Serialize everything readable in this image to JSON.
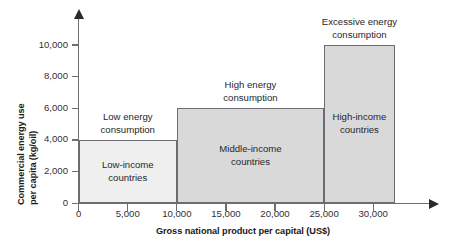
{
  "chart_data": {
    "type": "bar",
    "title": "",
    "xlabel": "Gross national product per capital (US$)",
    "ylabel_line1": "Commercial energy use",
    "ylabel_line2": "per capita (kg/oil)",
    "xlim": [
      0,
      36000
    ],
    "ylim": [
      0,
      11500
    ],
    "grid": false,
    "legend": "none",
    "x_ticks": [
      {
        "value": 0,
        "label": "0"
      },
      {
        "value": 5000,
        "label": "5,000"
      },
      {
        "value": 10000,
        "label": "10,000"
      },
      {
        "value": 15000,
        "label": "15,000"
      },
      {
        "value": 20000,
        "label": "20,000"
      },
      {
        "value": 25000,
        "label": "25,000"
      },
      {
        "value": 30000,
        "label": "30,000"
      }
    ],
    "y_ticks": [
      {
        "value": 0,
        "label": "0"
      },
      {
        "value": 2000,
        "label": "2,000"
      },
      {
        "value": 4000,
        "label": "4,000"
      },
      {
        "value": 6000,
        "label": "6,000"
      },
      {
        "value": 8000,
        "label": "8,000"
      },
      {
        "value": 10000,
        "label": "10,000"
      }
    ],
    "bars": [
      {
        "name": "low-income",
        "x_start": 0,
        "x_end": 10000,
        "value": 4000,
        "fill": "#efefef",
        "stroke": "#6b6b70",
        "inner_label": "Low-income\ncountries",
        "outer_label": "Low energy\nconsumption"
      },
      {
        "name": "middle-income",
        "x_start": 10000,
        "x_end": 25000,
        "value": 6000,
        "fill": "#d9d9d9",
        "stroke": "#6b6b70",
        "inner_label": "Middle-income\ncountries",
        "outer_label": "High energy\nconsumption"
      },
      {
        "name": "high-income",
        "x_start": 25000,
        "x_end": 32200,
        "value": 10000,
        "fill": "#d9d9d9",
        "stroke": "#6b6b70",
        "inner_label": "High-income\ncountries",
        "outer_label": "Excessive energy\nconsumption"
      }
    ]
  }
}
